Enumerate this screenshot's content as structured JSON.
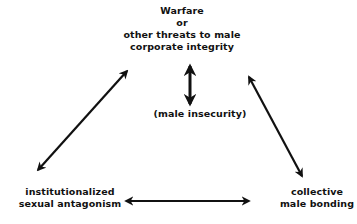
{
  "diagram": {
    "nodes": {
      "top": {
        "lines": [
          "Warfare",
          "or",
          "other threats to male",
          "corporate integrity"
        ]
      },
      "middle": {
        "label": "(male insecurity)"
      },
      "bottom_left": {
        "lines": [
          "institutionalized",
          "sexual antagonism"
        ]
      },
      "bottom_right": {
        "lines": [
          "collective",
          "male bonding"
        ]
      }
    },
    "edges": [
      {
        "from": "top",
        "to": "middle",
        "type": "bidirectional"
      },
      {
        "from": "top",
        "to": "bottom_left",
        "type": "bidirectional"
      },
      {
        "from": "top",
        "to": "bottom_right",
        "type": "bidirectional"
      },
      {
        "from": "bottom_left",
        "to": "bottom_right",
        "type": "bidirectional"
      }
    ],
    "colors": {
      "line": "#111111",
      "background": "#ffffff"
    }
  }
}
